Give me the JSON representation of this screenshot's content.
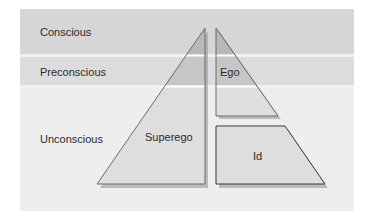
{
  "diagram": {
    "levels": [
      {
        "id": "conscious",
        "label": "Conscious"
      },
      {
        "id": "preconscious",
        "label": "Preconscious"
      },
      {
        "id": "unconscious",
        "label": "Unconscious"
      }
    ],
    "structures": [
      {
        "id": "superego",
        "label": "Superego"
      },
      {
        "id": "ego",
        "label": "Ego"
      },
      {
        "id": "id",
        "label": "Id"
      }
    ],
    "colors": {
      "conscious_band": "#d6d6d6",
      "preconscious_band": "#dcdcdc",
      "unconscious_band": "#eeeeee",
      "shape_top": "#b8b8b8",
      "shape_middle": "#c8c8c8",
      "shape_bottom": "#dedede",
      "edge": "#555555"
    }
  }
}
